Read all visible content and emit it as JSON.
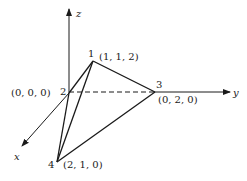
{
  "diagram": {
    "type": "3d-tetrahedron-axes",
    "axes": {
      "x": {
        "label": "x"
      },
      "y": {
        "label": "y"
      },
      "z": {
        "label": "z"
      }
    },
    "vertices": [
      {
        "id": "1",
        "coord_label": "(1, 1, 2)"
      },
      {
        "id": "2",
        "coord_label": "(0, 0, 0)"
      },
      {
        "id": "3",
        "coord_label": "(0, 2, 0)"
      },
      {
        "id": "4",
        "coord_label": "(2, 1, 0)"
      }
    ],
    "edges": [
      {
        "from": "1",
        "to": "2",
        "style": "solid"
      },
      {
        "from": "1",
        "to": "3",
        "style": "solid"
      },
      {
        "from": "1",
        "to": "4",
        "style": "solid"
      },
      {
        "from": "2",
        "to": "4",
        "style": "solid"
      },
      {
        "from": "3",
        "to": "4",
        "style": "solid"
      },
      {
        "from": "2",
        "to": "3",
        "style": "dashed"
      }
    ],
    "colors": {
      "stroke": "#1a1a1a",
      "background": "#ffffff"
    }
  }
}
